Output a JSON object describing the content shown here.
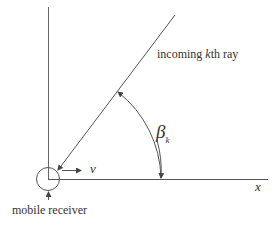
{
  "diagram": {
    "ray_label_prefix": "incoming ",
    "ray_label_k": "k",
    "ray_label_suffix": "th ray",
    "angle_symbol": "β",
    "angle_subscript": "k",
    "velocity_label": "v",
    "x_axis_label": "x",
    "receiver_label": "mobile receiver"
  },
  "colors": {
    "line": "#555555",
    "text": "#333333",
    "background": "#ffffff"
  }
}
